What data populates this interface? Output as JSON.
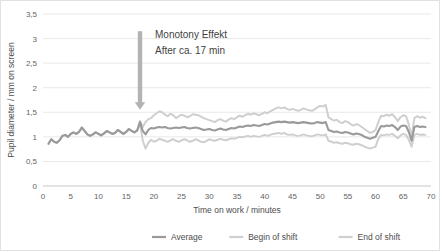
{
  "chart_data": {
    "type": "line",
    "title": "",
    "xlabel": "Time on work / minutes",
    "ylabel": "Pupil diameter / mm on screen",
    "xlim": [
      0,
      70
    ],
    "ylim": [
      0,
      3.5
    ],
    "xticks": [
      "0",
      "5",
      "10",
      "15",
      "20",
      "25",
      "30",
      "35",
      "40",
      "45",
      "50",
      "55",
      "60",
      "65",
      "70"
    ],
    "xtick_values": [
      0,
      5,
      10,
      15,
      20,
      25,
      30,
      35,
      40,
      45,
      50,
      55,
      60,
      65,
      70
    ],
    "yticks": [
      "0",
      "0,5",
      "1",
      "1,5",
      "2",
      "2,5",
      "3",
      "3,5"
    ],
    "ytick_values": [
      0,
      0.5,
      1,
      1.5,
      2,
      2.5,
      3,
      3.5
    ],
    "grid": "horizontal",
    "legend_position": "bottom",
    "annotations": [
      {
        "name": "monotony-annotation",
        "line1": "Monotony Effekt",
        "line2": "After ca. 17 min",
        "arrow_x": 17.5,
        "arrow_from_y": 3.15,
        "arrow_to_y": 1.55,
        "color": "#b3b3b3"
      }
    ],
    "x": [
      1,
      1.5,
      2,
      2.5,
      3,
      3.5,
      4,
      4.5,
      5,
      5.5,
      6,
      6.5,
      7,
      7.5,
      8,
      8.5,
      9,
      9.5,
      10,
      10.5,
      11,
      11.5,
      12,
      12.5,
      13,
      13.5,
      14,
      14.5,
      15,
      15.5,
      16,
      16.5,
      17,
      17.5,
      18,
      18.5,
      19,
      19.5,
      20,
      20.5,
      21,
      21.5,
      22,
      22.5,
      23,
      23.5,
      24,
      24.5,
      25,
      25.5,
      26,
      26.5,
      27,
      27.5,
      28,
      28.5,
      29,
      29.5,
      30,
      30.5,
      31,
      31.5,
      32,
      32.5,
      33,
      33.5,
      34,
      34.5,
      35,
      35.5,
      36,
      36.5,
      37,
      37.5,
      38,
      38.5,
      39,
      39.5,
      40,
      40.5,
      41,
      41.5,
      42,
      42.5,
      43,
      43.5,
      44,
      44.5,
      45,
      45.5,
      46,
      46.5,
      47,
      47.5,
      48,
      48.5,
      49,
      49.5,
      50,
      50.5,
      51,
      51.5,
      52,
      52.5,
      53,
      53.5,
      54,
      54.5,
      55,
      55.5,
      56,
      56.5,
      57,
      57.5,
      58,
      58.5,
      59,
      59.5,
      60,
      60.5,
      61,
      61.5,
      62,
      62.5,
      63,
      63.5,
      64,
      64.5,
      65,
      65.5,
      66,
      66.5,
      67,
      67.5,
      68,
      68.5,
      69
    ],
    "series": [
      {
        "name": "Average",
        "color": "#9a9a9a",
        "width": 2.1,
        "values": [
          0.86,
          0.95,
          0.9,
          0.88,
          0.93,
          1.02,
          1.04,
          1.0,
          1.06,
          1.09,
          1.06,
          1.1,
          1.19,
          1.12,
          1.05,
          1.02,
          1.05,
          1.09,
          1.06,
          1.03,
          1.07,
          1.12,
          1.09,
          1.06,
          1.08,
          1.14,
          1.1,
          1.06,
          1.1,
          1.16,
          1.12,
          1.09,
          1.13,
          1.3,
          1.12,
          1.05,
          1.14,
          1.18,
          1.17,
          1.19,
          1.2,
          1.19,
          1.2,
          1.18,
          1.17,
          1.18,
          1.19,
          1.18,
          1.19,
          1.2,
          1.18,
          1.17,
          1.18,
          1.19,
          1.18,
          1.16,
          1.14,
          1.15,
          1.16,
          1.14,
          1.13,
          1.15,
          1.17,
          1.15,
          1.14,
          1.16,
          1.18,
          1.17,
          1.19,
          1.21,
          1.2,
          1.22,
          1.23,
          1.22,
          1.24,
          1.23,
          1.22,
          1.24,
          1.26,
          1.25,
          1.27,
          1.29,
          1.3,
          1.31,
          1.3,
          1.31,
          1.3,
          1.29,
          1.3,
          1.29,
          1.28,
          1.29,
          1.3,
          1.29,
          1.28,
          1.27,
          1.28,
          1.3,
          1.29,
          1.28,
          1.3,
          1.14,
          1.12,
          1.1,
          1.11,
          1.09,
          1.08,
          1.1,
          1.09,
          1.07,
          1.05,
          1.07,
          1.06,
          1.04,
          1.0,
          0.98,
          0.96,
          0.98,
          1.0,
          1.12,
          1.22,
          1.21,
          1.23,
          1.22,
          1.24,
          1.2,
          1.14,
          1.21,
          1.23,
          1.22,
          1.1,
          0.92,
          1.2,
          1.22,
          1.2,
          1.21,
          1.2
        ]
      },
      {
        "name": "Begin of shift",
        "color": "#cfcfcf",
        "width": 2.0,
        "values": [
          0.86,
          0.95,
          0.9,
          0.88,
          0.93,
          1.02,
          1.04,
          1.0,
          1.06,
          1.09,
          1.06,
          1.1,
          1.19,
          1.12,
          1.05,
          1.02,
          1.05,
          1.09,
          1.06,
          1.03,
          1.07,
          1.12,
          1.09,
          1.06,
          1.08,
          1.14,
          1.1,
          1.06,
          1.1,
          1.16,
          1.12,
          1.09,
          1.13,
          1.32,
          1.2,
          1.3,
          1.36,
          1.38,
          1.44,
          1.48,
          1.52,
          1.5,
          1.45,
          1.42,
          1.47,
          1.44,
          1.38,
          1.42,
          1.45,
          1.43,
          1.4,
          1.42,
          1.46,
          1.45,
          1.44,
          1.41,
          1.38,
          1.36,
          1.34,
          1.32,
          1.3,
          1.34,
          1.36,
          1.33,
          1.31,
          1.35,
          1.38,
          1.36,
          1.4,
          1.43,
          1.41,
          1.44,
          1.47,
          1.45,
          1.48,
          1.46,
          1.44,
          1.47,
          1.5,
          1.48,
          1.52,
          1.55,
          1.58,
          1.6,
          1.58,
          1.6,
          1.57,
          1.55,
          1.57,
          1.55,
          1.53,
          1.55,
          1.58,
          1.56,
          1.54,
          1.53,
          1.56,
          1.6,
          1.63,
          1.62,
          1.65,
          1.4,
          1.36,
          1.33,
          1.35,
          1.3,
          1.28,
          1.32,
          1.3,
          1.26,
          1.23,
          1.26,
          1.24,
          1.2,
          1.16,
          1.12,
          1.08,
          1.1,
          1.14,
          1.3,
          1.43,
          1.42,
          1.45,
          1.43,
          1.46,
          1.4,
          1.32,
          1.4,
          1.44,
          1.42,
          1.25,
          1.0,
          1.38,
          1.42,
          1.39,
          1.41,
          1.38
        ]
      },
      {
        "name": "End of shift",
        "color": "#cfcfcf",
        "width": 2.0,
        "values": [
          0.86,
          0.95,
          0.9,
          0.88,
          0.93,
          1.02,
          1.04,
          1.0,
          1.06,
          1.09,
          1.06,
          1.1,
          1.19,
          1.12,
          1.05,
          1.02,
          1.05,
          1.09,
          1.06,
          1.03,
          1.07,
          1.12,
          1.09,
          1.06,
          1.08,
          1.14,
          1.1,
          1.06,
          1.1,
          1.16,
          1.12,
          1.09,
          1.13,
          1.28,
          0.92,
          0.76,
          0.88,
          0.94,
          0.9,
          0.92,
          0.96,
          0.94,
          0.92,
          0.9,
          0.93,
          0.95,
          0.92,
          0.9,
          0.93,
          0.95,
          0.93,
          0.9,
          0.92,
          0.95,
          0.93,
          0.9,
          0.89,
          0.92,
          0.95,
          0.93,
          0.92,
          0.94,
          0.96,
          0.94,
          0.93,
          0.95,
          0.97,
          0.96,
          0.98,
          1.0,
          0.99,
          1.01,
          1.02,
          1.0,
          1.02,
          1.01,
          1.0,
          1.02,
          1.04,
          1.02,
          1.04,
          1.06,
          1.07,
          1.08,
          1.06,
          1.08,
          1.05,
          1.04,
          1.05,
          1.03,
          1.02,
          1.03,
          1.05,
          1.03,
          1.02,
          1.01,
          1.03,
          1.05,
          1.04,
          1.03,
          1.05,
          0.92,
          0.9,
          0.88,
          0.89,
          0.87,
          0.86,
          0.88,
          0.87,
          0.85,
          0.84,
          0.86,
          0.85,
          0.83,
          0.8,
          0.78,
          0.76,
          0.78,
          0.8,
          0.96,
          1.04,
          1.03,
          1.05,
          1.04,
          1.06,
          1.02,
          0.97,
          1.03,
          1.06,
          1.04,
          0.94,
          0.8,
          1.04,
          1.06,
          1.04,
          1.05,
          1.04
        ]
      }
    ],
    "legend": [
      {
        "label": "Average",
        "color": "#9a9a9a"
      },
      {
        "label": "Begin of shift",
        "color": "#cfcfcf"
      },
      {
        "label": "End of shift",
        "color": "#cfcfcf"
      }
    ]
  }
}
